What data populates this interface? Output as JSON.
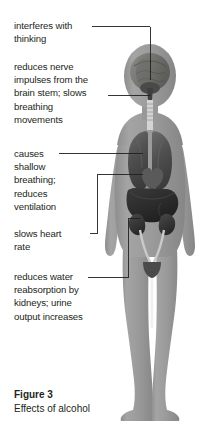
{
  "figure": {
    "caption_label": "Figure 3",
    "caption_text": "Effects of alcohol",
    "colors": {
      "background": "#ffffff",
      "body_silhouette": "#9a9a9a",
      "body_outline": "#b5b5b5",
      "organ_dark": "#3a3a3a",
      "organ_mid": "#5e5e5e",
      "organ_light": "#7e7e7e",
      "brain": "#7a7a78",
      "leader_line": "#231f20",
      "text": "#231f20"
    }
  },
  "callouts": [
    {
      "id": "interferes-with-thinking",
      "text": "interferes with\nthinking",
      "target_organ": "brain"
    },
    {
      "id": "reduces-nerve-impulses",
      "text": "reduces nerve\nimpulses from the\nbrain stem; slows\nbreathing\nmovements",
      "target_organ": "brain-stem"
    },
    {
      "id": "causes-shallow-breathing",
      "text": "causes\nshallow\nbreathing;\nreduces\nventilation",
      "target_organ": "lungs"
    },
    {
      "id": "slows-heart-rate",
      "text": "slows heart\nrate",
      "target_organ": "heart"
    },
    {
      "id": "reduces-water-reabsorption",
      "text": "reduces water\nreabsorption by\nkidneys; urine\noutput increases",
      "target_organ": "kidneys"
    }
  ]
}
